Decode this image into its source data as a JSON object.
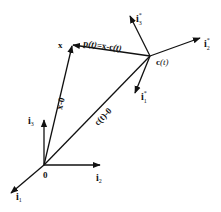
{
  "diagram": {
    "type": "vector-frame-diagram",
    "colors": {
      "stroke": "#111111",
      "background": "#ffffff"
    },
    "origin": {
      "label": "0"
    },
    "fixed_frame": {
      "i1": {
        "base": "i",
        "sub": "1"
      },
      "i2": {
        "base": "i",
        "sub": "2"
      },
      "i3": {
        "base": "i",
        "sub": "3"
      }
    },
    "moving_frame": {
      "i1": {
        "base": "i",
        "sup": "*",
        "sub": "1"
      },
      "i2": {
        "base": "i",
        "sup": "*",
        "sub": "2"
      },
      "i3": {
        "base": "i",
        "sup": "*",
        "sub": "3"
      }
    },
    "points": {
      "x": {
        "label": "x"
      },
      "c": {
        "label_bold": "c",
        "label_italic": "(t)"
      }
    },
    "vectors": {
      "x_minus_0": {
        "label": "x-0"
      },
      "c_minus_0": {
        "label": "c(t)-0"
      },
      "p": {
        "label_p": "p",
        "label_t": "(t)",
        "label_eq": "=x-c",
        "label_t2": "(t)"
      }
    }
  }
}
